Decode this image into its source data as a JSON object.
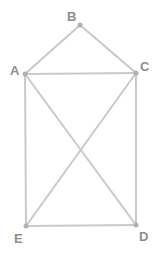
{
  "diagram": {
    "type": "graph",
    "line_color": "#c9c9c9",
    "vertex_color": "#b0b0b0",
    "label_color": "#8e8e8e",
    "vertices": [
      {
        "id": "A",
        "label": "A",
        "x": 25,
        "y": 74
      },
      {
        "id": "B",
        "label": "B",
        "x": 80,
        "y": 25
      },
      {
        "id": "C",
        "label": "C",
        "x": 136,
        "y": 73
      },
      {
        "id": "D",
        "label": "D",
        "x": 136,
        "y": 225
      },
      {
        "id": "E",
        "label": "E",
        "x": 26,
        "y": 226
      }
    ],
    "edges": [
      [
        "A",
        "B"
      ],
      [
        "B",
        "C"
      ],
      [
        "A",
        "C"
      ],
      [
        "A",
        "E"
      ],
      [
        "C",
        "D"
      ],
      [
        "E",
        "D"
      ],
      [
        "A",
        "D"
      ],
      [
        "C",
        "E"
      ]
    ]
  }
}
